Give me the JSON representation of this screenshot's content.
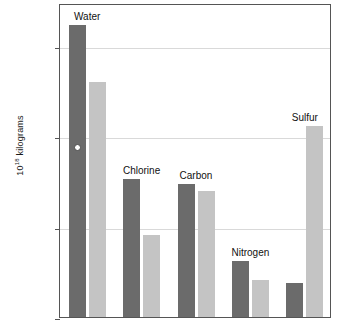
{
  "chart_data": {
    "type": "bar",
    "title": "",
    "xlabel": "",
    "ylabel_prefix": "10",
    "ylabel_exponent": "18",
    "ylabel_suffix": " kilograms",
    "ylabel_full": "10¹⁸ kilograms",
    "scale": "log",
    "ylim": [
      1,
      3000
    ],
    "grid": true,
    "legend": "none",
    "ytick_labels": [
      "1000",
      "100",
      "10",
      "1"
    ],
    "ytick_values": [
      1000,
      100,
      10,
      1
    ],
    "categories": [
      "Water",
      "Chlorine",
      "Carbon",
      "Nitrogen",
      "Sulfur"
    ],
    "series": [
      {
        "name": "dark",
        "color": "#6b6b6b",
        "values": [
          1700,
          34,
          30,
          4.2,
          2.4
        ]
      },
      {
        "name": "light",
        "color": "#c4c4c4",
        "values": [
          400,
          8,
          25,
          2.6,
          130
        ]
      }
    ],
    "annotations": [
      {
        "name": "water-dark-point-marker",
        "category": "Water",
        "series": "dark",
        "value": 80
      }
    ]
  },
  "axis": {
    "caption": ""
  }
}
